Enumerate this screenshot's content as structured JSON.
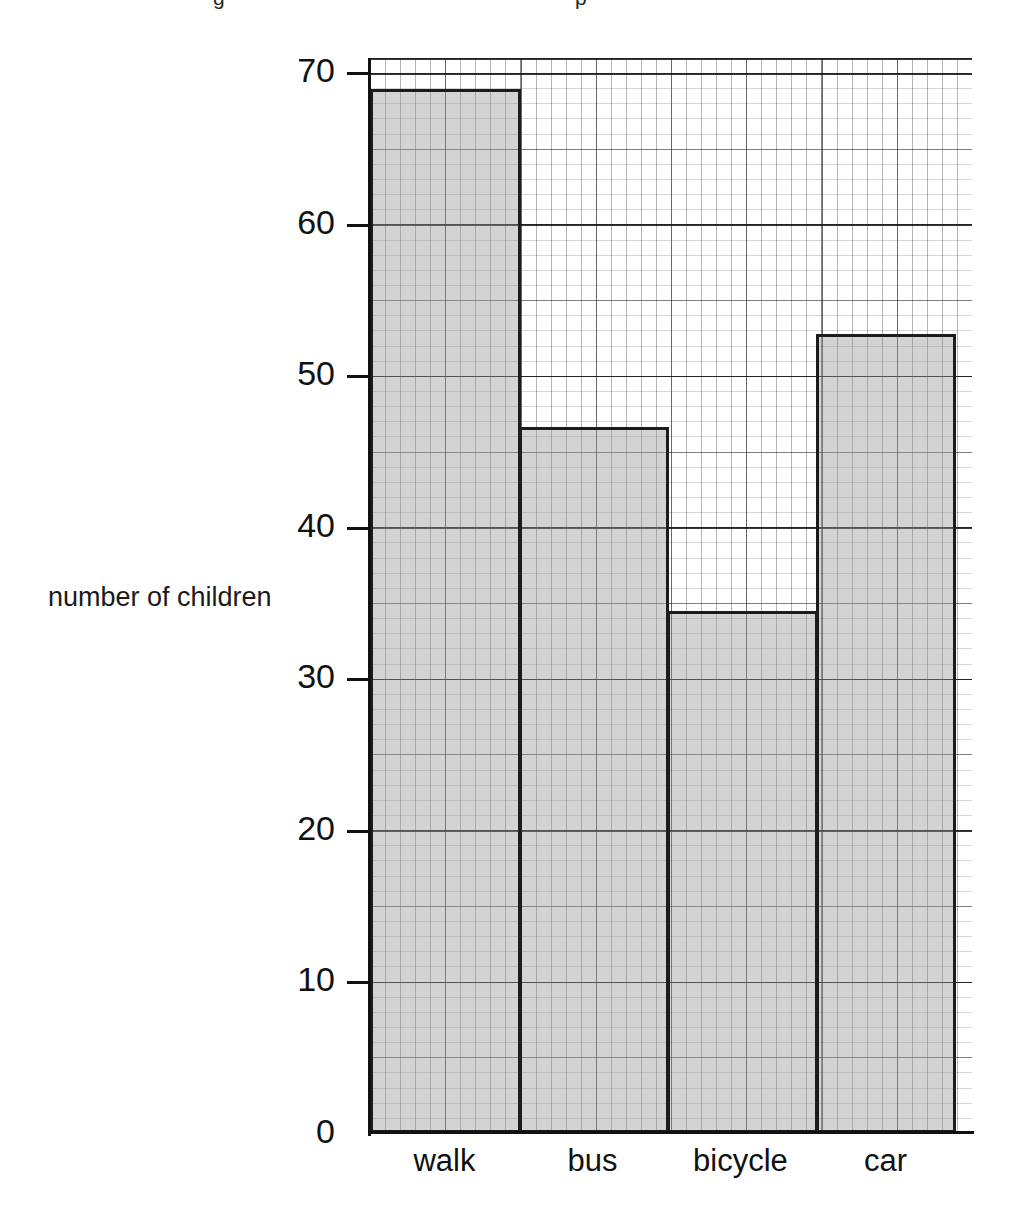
{
  "page": {
    "background_color": "#ffffff",
    "top_remnant": {
      "visible": true,
      "fragments": [
        "g",
        "p",
        "",
        "",
        ""
      ]
    }
  },
  "chart_data": {
    "type": "bar",
    "title": "",
    "subtitle": "",
    "xlabel": "",
    "ylabel": "number of children",
    "categories": [
      "walk",
      "bus",
      "bicycle",
      "car"
    ],
    "values": [
      68,
      46,
      34,
      52
    ],
    "series": [
      {
        "name": "number of children",
        "values": [
          68,
          46,
          34,
          52
        ]
      }
    ],
    "ylim": [
      0,
      70
    ],
    "ytick_labels": [
      "0",
      "10",
      "20",
      "30",
      "40",
      "50",
      "60",
      "70"
    ],
    "ytick_values": [
      0,
      10,
      20,
      30,
      40,
      50,
      60,
      70
    ],
    "ytick_step": 10,
    "grid": true,
    "grid_minor_step": 1,
    "grid_medium_step": 5,
    "grid_major_step": 10,
    "legend": false,
    "legend_position": "none",
    "bar_fill_color": "#c8c8c8",
    "bar_edge_color": "#1c1c1c",
    "axis_color": "#111111",
    "annotations": []
  },
  "axis": {
    "y_title": "number of children",
    "ticks": [
      {
        "label": "70",
        "value": 70
      },
      {
        "label": "60",
        "value": 60
      },
      {
        "label": "50",
        "value": 50
      },
      {
        "label": "40",
        "value": 40
      },
      {
        "label": "30",
        "value": 30
      },
      {
        "label": "20",
        "value": 20
      },
      {
        "label": "10",
        "value": 10
      },
      {
        "label": "0",
        "value": 0
      }
    ]
  },
  "bars": [
    {
      "label": "walk",
      "value": 68
    },
    {
      "label": "bus",
      "value": 46
    },
    {
      "label": "bicycle",
      "value": 34
    },
    {
      "label": "car",
      "value": 52
    }
  ]
}
